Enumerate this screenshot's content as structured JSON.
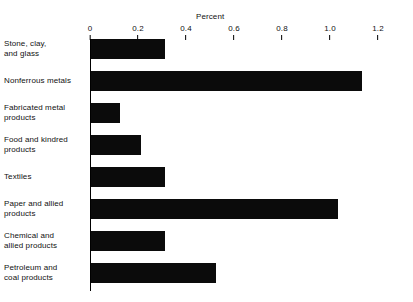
{
  "chart_data": {
    "type": "bar",
    "orientation": "horizontal",
    "title": "",
    "xlabel": "Percent",
    "ylabel": "",
    "xlim": [
      0,
      1.2
    ],
    "grid": false,
    "legend": null,
    "xticks": [
      "0",
      "0.2",
      "0.4",
      "0.6",
      "0.8",
      "1.0",
      "1.2"
    ],
    "xtick_values": [
      0,
      0.2,
      0.4,
      0.6,
      0.8,
      1.0,
      1.2
    ],
    "categories": [
      "Stone, clay, and glass",
      "Nonferrous metals",
      "Fabricated metal products",
      "Food and kindred products",
      "Textiles",
      "Paper and allied products",
      "Chemical and allied products",
      "Petroleum and coal products"
    ],
    "category_lines": [
      [
        "Stone, clay,",
        "and glass"
      ],
      [
        "Nonferrous metals"
      ],
      [
        "Fabricated metal",
        "products"
      ],
      [
        "Food and kindred",
        "products"
      ],
      [
        "Textiles"
      ],
      [
        "Paper and allied",
        "products"
      ],
      [
        "Chemical and",
        "allied products"
      ],
      [
        "Petroleum and",
        "coal products"
      ]
    ],
    "values": [
      0.31,
      1.13,
      0.12,
      0.21,
      0.31,
      1.03,
      0.31,
      0.52
    ],
    "bar_color": "#0b0b0b",
    "background_color": "#ffffff"
  }
}
